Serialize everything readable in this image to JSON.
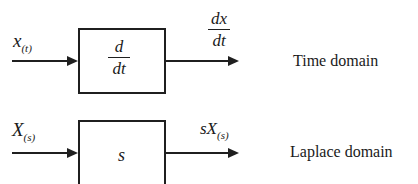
{
  "diagram": {
    "rows": [
      {
        "input": {
          "main": "x",
          "sub": "(t)"
        },
        "block": {
          "numerator": "d",
          "denominator": "dt"
        },
        "output": {
          "numerator": "dx",
          "denominator": "dt"
        },
        "domain_label": "Time domain"
      },
      {
        "input": {
          "main": "X",
          "sub": "(s)"
        },
        "block": {
          "label": "s"
        },
        "output": {
          "main": "sX",
          "sub": "(s)"
        },
        "domain_label": "Laplace domain"
      }
    ],
    "colors": {
      "stroke": "#1f1f1f",
      "background": "#ffffff",
      "text": "#1a1a1a"
    }
  }
}
